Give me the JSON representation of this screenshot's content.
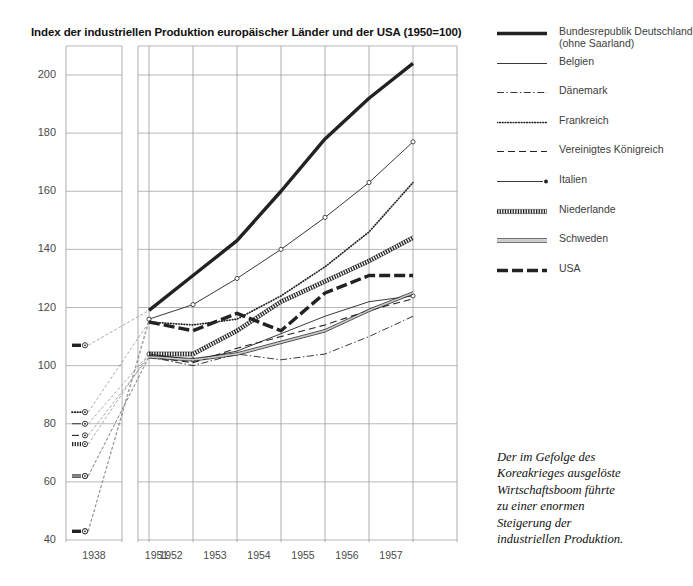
{
  "chart_data": {
    "type": "line",
    "title": "Index der industriellen Produktion europäischer Länder und der USA (1950=100)",
    "xlabel": "",
    "ylabel": "",
    "ylim": [
      40,
      210
    ],
    "yticks": [
      40,
      60,
      80,
      100,
      120,
      140,
      160,
      180,
      200
    ],
    "x": [
      "1938",
      "1951",
      "1952",
      "1953",
      "1954",
      "1955",
      "1956",
      "1957"
    ],
    "x_gap_after": "1938",
    "grid": true,
    "legend_position": "right",
    "series": [
      {
        "name": "Bundesrepublik Deutschland (ohne Saarland)",
        "style": "thick-solid",
        "values": [
          107,
          119,
          131,
          143,
          160,
          178,
          192,
          204
        ]
      },
      {
        "name": "Belgien",
        "style": "thin-solid",
        "values": [
          80,
          104,
          102,
          105,
          111,
          117,
          122,
          124
        ]
      },
      {
        "name": "Dänemark",
        "style": "dash-dot",
        "values": [
          62,
          103,
          100,
          104,
          102,
          104,
          110,
          117
        ]
      },
      {
        "name": "Frankreich",
        "style": "dotted",
        "values": [
          84,
          115,
          114,
          116,
          124,
          134,
          146,
          163
        ]
      },
      {
        "name": "Vereinigtes Königreich",
        "style": "dashed",
        "values": [
          76,
          103,
          101,
          106,
          110,
          114,
          119,
          123
        ]
      },
      {
        "name": "Italien",
        "style": "thin-solid-marker",
        "values": [
          43,
          116,
          121,
          130,
          140,
          151,
          163,
          177
        ]
      },
      {
        "name": "Niederlande",
        "style": "fine-dotted",
        "values": [
          73,
          104,
          104,
          112,
          122,
          129,
          136,
          144
        ]
      },
      {
        "name": "Schweden",
        "style": "double-line",
        "values": [
          62,
          103,
          102,
          104,
          108,
          112,
          119,
          125
        ]
      },
      {
        "name": "USA",
        "style": "thick-dashed",
        "values": [
          43,
          115,
          112,
          118,
          112,
          125,
          131,
          131
        ]
      }
    ]
  },
  "legend": {
    "items": [
      {
        "label_line1": "Bundesrepublik Deutschland",
        "label_line2": "(ohne Saarland)",
        "style": "thick-solid"
      },
      {
        "label_line1": "Belgien",
        "label_line2": "",
        "style": "thin-solid"
      },
      {
        "label_line1": "Dänemark",
        "label_line2": "",
        "style": "dash-dot"
      },
      {
        "label_line1": "Frankreich",
        "label_line2": "",
        "style": "dotted"
      },
      {
        "label_line1": "Vereinigtes Königreich",
        "label_line2": "",
        "style": "dashed"
      },
      {
        "label_line1": "Italien",
        "label_line2": "",
        "style": "thin-solid-marker"
      },
      {
        "label_line1": "Niederlande",
        "label_line2": "",
        "style": "fine-dotted"
      },
      {
        "label_line1": "Schweden",
        "label_line2": "",
        "style": "double-line"
      },
      {
        "label_line1": "USA",
        "label_line2": "",
        "style": "thick-dashed"
      }
    ]
  },
  "caption": {
    "lines": [
      "Der im Gefolge des",
      "Koreakrieges ausgelöste",
      "Wirtschaftsboom führte",
      "zu einer enormen",
      "Steigerung der",
      "industriellen Produktion."
    ]
  },
  "colors": {
    "ink": "#111111",
    "grid": "#9a9a9a",
    "axis_text": "#4a4a4a",
    "line": "#222222"
  }
}
